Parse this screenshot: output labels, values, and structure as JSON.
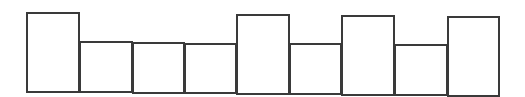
{
  "diagram": {
    "type": "row-of-rectangles",
    "stroke_color": "#3a3a3a",
    "background": "#ffffff",
    "boxes": [
      {
        "index": 1,
        "left": 26,
        "right": 80,
        "top": 12,
        "bottom": 93,
        "size": "tall"
      },
      {
        "index": 2,
        "left": 79,
        "right": 133,
        "top": 41,
        "bottom": 93,
        "size": "short"
      },
      {
        "index": 3,
        "left": 132,
        "right": 185,
        "top": 42,
        "bottom": 94,
        "size": "short"
      },
      {
        "index": 4,
        "left": 184,
        "right": 237,
        "top": 43,
        "bottom": 94,
        "size": "short"
      },
      {
        "index": 5,
        "left": 236,
        "right": 290,
        "top": 14,
        "bottom": 95,
        "size": "tall"
      },
      {
        "index": 6,
        "left": 289,
        "right": 342,
        "top": 43,
        "bottom": 95,
        "size": "short"
      },
      {
        "index": 7,
        "left": 341,
        "right": 395,
        "top": 15,
        "bottom": 96,
        "size": "tall"
      },
      {
        "index": 8,
        "left": 394,
        "right": 448,
        "top": 44,
        "bottom": 96,
        "size": "short"
      },
      {
        "index": 9,
        "left": 447,
        "right": 500,
        "top": 16,
        "bottom": 97,
        "size": "tall"
      }
    ]
  }
}
